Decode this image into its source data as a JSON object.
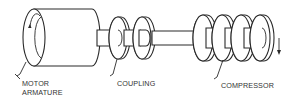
{
  "figure": {
    "type": "technical-illustration",
    "line_color": "#2a2a2a",
    "background": "#ffffff"
  },
  "labels": {
    "motor_line1": "MOTOR",
    "motor_line2": "ARMATURE",
    "coupling": "COUPLING",
    "compressor": "COMPRESSOR"
  },
  "components": [
    {
      "id": "motor-armature",
      "label_ref": "labels.motor_line1"
    },
    {
      "id": "coupling",
      "label_ref": "labels.coupling"
    },
    {
      "id": "compressor",
      "label_ref": "labels.compressor",
      "stages": 4
    }
  ],
  "annotations": {
    "rotation_arrows": 2
  }
}
